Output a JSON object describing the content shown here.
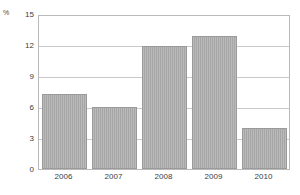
{
  "chart_data": {
    "type": "bar",
    "title": "",
    "subtitle": "",
    "xlabel": "",
    "ylabel": "%",
    "unit_label": "%",
    "categories": [
      "2006",
      "2007",
      "2008",
      "2009",
      "2010"
    ],
    "values": [
      7.4,
      6.1,
      12.1,
      13.0,
      4.0
    ],
    "series": [
      {
        "name": "",
        "values": [
          7.4,
          6.1,
          12.1,
          13.0,
          4.0
        ]
      }
    ],
    "ylim": [
      0,
      15
    ],
    "xlim": [
      0,
      5
    ],
    "yticks": [
      0,
      3,
      6,
      9,
      12,
      15
    ],
    "ytick_labels": [
      "0",
      "3",
      "6",
      "9",
      "12",
      "15"
    ],
    "xtick_labels": [
      "2006",
      "2007",
      "2008",
      "2009",
      "2010"
    ],
    "grid": {
      "horizontal": true,
      "vertical": false
    },
    "legend": {
      "visible": false,
      "position": "none",
      "entries": []
    },
    "annotations": [],
    "colors": {
      "bar_fill": "#adadad",
      "bar_border": "#9a9a9a",
      "gridline": "#c9c9c9",
      "frame": "#b9b9b9",
      "text": "#3d3d3d",
      "background": "#ffffff"
    }
  }
}
